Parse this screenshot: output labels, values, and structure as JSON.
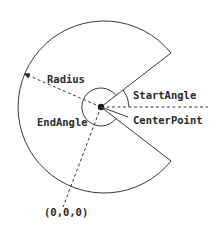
{
  "diagram": {
    "title": "",
    "labels": {
      "radius": "Radius",
      "start_angle": "StartAngle",
      "end_angle": "EndAngle",
      "center_point": "CenterPoint",
      "origin": "(0,0,0)"
    },
    "colors": {
      "line": "#3a3a3a",
      "text": "#2a2a2a",
      "background": "#ffffff"
    }
  }
}
